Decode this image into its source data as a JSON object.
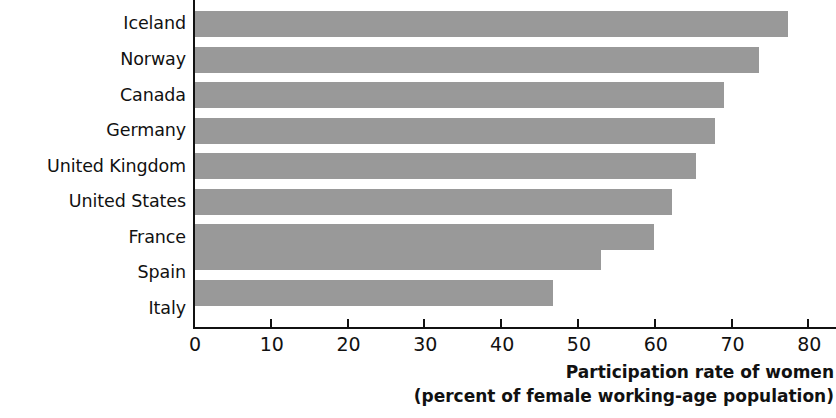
{
  "chart_data": {
    "type": "bar",
    "orientation": "horizontal",
    "title": "",
    "subtitle": "",
    "xlabel": "Participation rate of women",
    "xlabel_line2": "(percent of female working-age population)",
    "ylabel": "",
    "categories": [
      "Iceland",
      "Norway",
      "Canada",
      "Germany",
      "United Kingdom",
      "United States",
      "France",
      "Spain",
      "Italy"
    ],
    "values": [
      77.4,
      73.6,
      69.0,
      67.9,
      65.4,
      62.3,
      59.9,
      53.0,
      46.8
    ],
    "xlim": [
      0,
      80
    ],
    "xticks": [
      0,
      10,
      20,
      30,
      40,
      50,
      60,
      70,
      80
    ],
    "xtick_labels": [
      "0",
      "10",
      "20",
      "30",
      "40",
      "50",
      "60",
      "70",
      "80"
    ],
    "grid": false,
    "legend": false,
    "bar_color": "#999999",
    "axis_color": "#111111",
    "background": "#ffffff"
  }
}
